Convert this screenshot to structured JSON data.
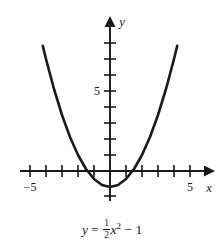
{
  "figure": {
    "title": "",
    "background_color": "#ffffff",
    "curve_color": "#1a1a1a",
    "axis_color": "#1a1a1a"
  },
  "equation": {
    "lhs": "y",
    "equals": "=",
    "frac_numerator": "1",
    "frac_denominator": "2",
    "variable": "x",
    "exponent": "2",
    "minus": "−",
    "constant": "1",
    "plain_text": "y = 1/2 x^2 - 1"
  },
  "axes": {
    "x_axis_label": "x",
    "y_axis_label": "y",
    "x_tick_labels": [
      {
        "value": -5,
        "text": "−5"
      },
      {
        "value": 5,
        "text": "5"
      }
    ],
    "y_tick_labels": [
      {
        "value": 5,
        "text": "5"
      }
    ],
    "x_range": [
      -5.7,
      6.1
    ],
    "y_range": [
      -1.7,
      9.6
    ],
    "x_ticks": [
      -5,
      -4,
      -3,
      -2,
      -1,
      1,
      2,
      3,
      4,
      5
    ],
    "y_ticks": [
      1,
      2,
      3,
      4,
      5,
      6,
      7,
      8,
      -1
    ],
    "grid": false,
    "arrow_on_positive_x": true,
    "arrow_on_positive_y": true
  },
  "chart_data": {
    "type": "line",
    "title": "",
    "xlabel": "x",
    "ylabel": "y",
    "function": "y = (1/2)x^2 - 1",
    "vertex": [
      0,
      -1
    ],
    "x_intercepts": [
      -1.414,
      1.414
    ],
    "y_intercept": -1,
    "xlim": [
      -5.7,
      6.1
    ],
    "ylim": [
      -1.7,
      9.6
    ],
    "grid": false,
    "legend": null,
    "series": [
      {
        "name": "y = 1/2 x^2 - 1",
        "x": [
          -4.2,
          -4.0,
          -3.5,
          -3.0,
          -2.5,
          -2.0,
          -1.5,
          -1.0,
          -0.5,
          0.0,
          0.5,
          1.0,
          1.5,
          2.0,
          2.5,
          3.0,
          3.5,
          4.0,
          4.2
        ],
        "values": [
          7.82,
          7.0,
          5.125,
          3.5,
          2.125,
          1.0,
          0.125,
          -0.5,
          -0.875,
          -1.0,
          -0.875,
          -0.5,
          0.125,
          1.0,
          2.125,
          3.5,
          5.125,
          7.0,
          7.82
        ]
      }
    ]
  }
}
